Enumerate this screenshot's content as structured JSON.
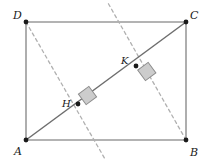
{
  "figure": {
    "type": "geometry-diagram",
    "canvas": {
      "width": 206,
      "height": 165,
      "background": "#ffffff"
    },
    "colors": {
      "rectangle_side": "#9a9a9a",
      "diagonal": "#6e6e6e",
      "dashed_line": "#b0b0b0",
      "point_dot": "#1a1a1a",
      "right_angle_fill": "#cccccc",
      "right_angle_stroke": "#8c8c8c",
      "label_text": "#1a1a1a"
    },
    "vertices": [
      {
        "name": "A",
        "label": "A",
        "x": 26,
        "y": 140,
        "label_x": 14,
        "label_y": 155
      },
      {
        "name": "B",
        "label": "B",
        "x": 186,
        "y": 140,
        "label_x": 190,
        "label_y": 156
      },
      {
        "name": "C",
        "label": "C",
        "x": 186,
        "y": 22,
        "label_x": 190,
        "label_y": 19
      },
      {
        "name": "D",
        "label": "D",
        "x": 26,
        "y": 22,
        "label_x": 13,
        "label_y": 19
      }
    ],
    "interior_points": [
      {
        "name": "H",
        "label": "H",
        "x": 78,
        "y": 104,
        "label_x": 62,
        "label_y": 107
      },
      {
        "name": "K",
        "label": "K",
        "x": 136,
        "y": 66,
        "label_x": 121,
        "label_y": 64
      }
    ],
    "sides": [
      {
        "name": "DC",
        "from": "D",
        "to": "C"
      },
      {
        "name": "AB",
        "from": "A",
        "to": "B"
      },
      {
        "name": "AD",
        "from": "A",
        "to": "D"
      },
      {
        "name": "BC",
        "from": "B",
        "to": "C"
      }
    ],
    "diagonal": {
      "name": "AC",
      "from": "A",
      "to": "C"
    },
    "dashed_lines": [
      {
        "name": "DH-extended",
        "description": "dashed perpendicular from D through H, extended below AB",
        "x1": 26,
        "y1": 22,
        "x2": 105,
        "y2": 159
      },
      {
        "name": "BK-extended",
        "description": "dashed perpendicular from B through K, extended above DC",
        "x1": 186,
        "y1": 140,
        "x2": 108,
        "y2": 3
      }
    ],
    "right_angle_markers": [
      {
        "name": "right-angle-at-H",
        "cx": 78,
        "cy": 104,
        "size": 13,
        "offset_along": 9,
        "offset_perp": 9
      },
      {
        "name": "right-angle-at-K",
        "cx": 136,
        "cy": 66,
        "size": 13,
        "offset_along": 9,
        "offset_perp": -9
      }
    ]
  }
}
